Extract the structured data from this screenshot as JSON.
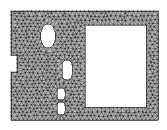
{
  "figure": {
    "description": "Unstructured triangular mesh of a rectangular plate containing one large rectangular cut-out, three rounded slot holes and a rectangular notch on the left edge",
    "canvas": {
      "width": 167,
      "height": 130
    },
    "colors": {
      "background": "#ffffff",
      "mesh_edge": "#1a1a1a",
      "mesh_fill": "#b9b9b9",
      "hole_fill": "#ffffff",
      "outline": "#1a1a1a"
    },
    "mesh": {
      "element_type": "triangle",
      "target_edge_length": 4.1,
      "jitter": 0.36,
      "seed": 20240517
    },
    "domain": {
      "name": "plate-outline",
      "type": "polygon",
      "points": [
        [
          11,
          11
        ],
        [
          158,
          11
        ],
        [
          158,
          120
        ],
        [
          11,
          120
        ],
        [
          11,
          72
        ],
        [
          17,
          72
        ],
        [
          17,
          55
        ],
        [
          11,
          55
        ]
      ]
    },
    "holes": [
      {
        "name": "rectangular-cutout",
        "type": "rect",
        "x": 85,
        "y": 25,
        "width": 61,
        "height": 82,
        "radius": 0
      },
      {
        "name": "upper-oval-hole",
        "type": "ellipse",
        "cx": 48,
        "cy": 36,
        "rx": 7.5,
        "ry": 12
      },
      {
        "name": "middle-slot-hole",
        "type": "roundrect",
        "x": 62,
        "y": 60,
        "width": 10,
        "height": 20,
        "radius": 5
      },
      {
        "name": "lower-slot-hole-upper",
        "type": "roundrect",
        "x": 57,
        "y": 88,
        "width": 8,
        "height": 12,
        "radius": 4
      },
      {
        "name": "lower-slot-hole-lower",
        "type": "roundrect",
        "x": 57,
        "y": 102,
        "width": 8,
        "height": 13,
        "radius": 4
      }
    ]
  }
}
